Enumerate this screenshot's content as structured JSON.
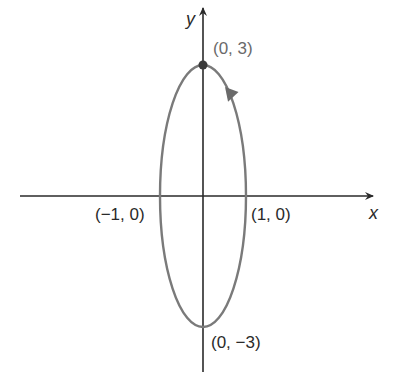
{
  "diagram": {
    "type": "parametric-ellipse",
    "axes": {
      "x_label": "x",
      "y_label": "y"
    },
    "points": [
      {
        "label": "(0, 3)",
        "x": 0,
        "y": 3,
        "marked": true
      },
      {
        "label": "(1, 0)",
        "x": 1,
        "y": 0
      },
      {
        "label": "(−1, 0)",
        "x": -1,
        "y": 0
      },
      {
        "label": "(0, −3)",
        "x": 0,
        "y": -3
      }
    ],
    "curve": {
      "shape": "ellipse",
      "semi_axis_x": 1,
      "semi_axis_y": 3,
      "direction": "clockwise",
      "start_point": "(0, 3)"
    },
    "colors": {
      "axis": "#2a2a2a",
      "curve": "#7a7a7a",
      "label": "#2a2a2a",
      "top_label": "#6a6a6a"
    }
  }
}
